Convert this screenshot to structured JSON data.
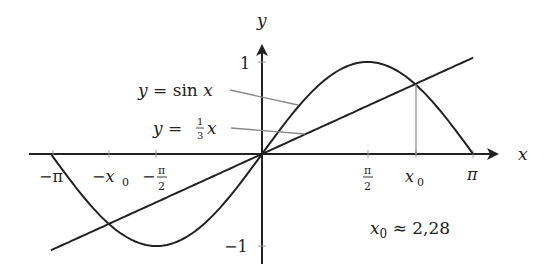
{
  "chart_data": {
    "type": "line",
    "title": "",
    "xlabel": "x",
    "ylabel": "y",
    "xlim": [
      -3.5,
      3.7
    ],
    "ylim": [
      -1.2,
      1.2
    ],
    "grid": false,
    "x_ticks": [
      {
        "value": -3.14159,
        "label": "−π"
      },
      {
        "value": -2.28,
        "label": "−x₀"
      },
      {
        "value": -1.5708,
        "label": "−π/2"
      },
      {
        "value": 1.5708,
        "label": "π/2"
      },
      {
        "value": 2.28,
        "label": "x₀"
      },
      {
        "value": 3.14159,
        "label": "π"
      }
    ],
    "y_ticks": [
      {
        "value": 1,
        "label": "1"
      },
      {
        "value": -1,
        "label": "−1"
      }
    ],
    "series": [
      {
        "name": "y = sin x",
        "function": "sin(x)",
        "domain": [
          -3.14159,
          3.14159
        ],
        "color": "#222222"
      },
      {
        "name": "y = (1/3) x",
        "function": "x/3",
        "domain": [
          -3.14159,
          3.14159
        ],
        "color": "#222222"
      }
    ],
    "intersections": [
      {
        "x": -2.28,
        "y": -0.76
      },
      {
        "x": 0,
        "y": 0
      },
      {
        "x": 2.28,
        "y": 0.76
      }
    ],
    "annotations": [
      {
        "text": "x₀ ≈ 2,28"
      },
      {
        "type": "vertical-drop",
        "x": 2.28,
        "from_y": 0.76,
        "to_y": 0
      }
    ]
  },
  "labels": {
    "x_axis": "x",
    "y_axis": "y",
    "tick_neg_pi": "−π",
    "tick_neg_x0_base": "−x",
    "tick_x0_base": "x",
    "sub0": "0",
    "pi": "π",
    "two": "2",
    "minus": "−",
    "one": "1",
    "neg_one": "−1",
    "sin_legend_y": "y",
    "sin_legend_eq": " = sin ",
    "sin_legend_x": "x",
    "line_legend_y": "y",
    "line_legend_eq": " = ",
    "line_legend_num": "1",
    "line_legend_den": "3",
    "line_legend_x": "x",
    "approx_x": "x",
    "approx_sub": "0",
    "approx_rest": " ≈ 2,28"
  },
  "geometry": {
    "origin": [
      262,
      154
    ],
    "px_per_unit_x": 67.2,
    "px_per_unit_y": 92
  }
}
